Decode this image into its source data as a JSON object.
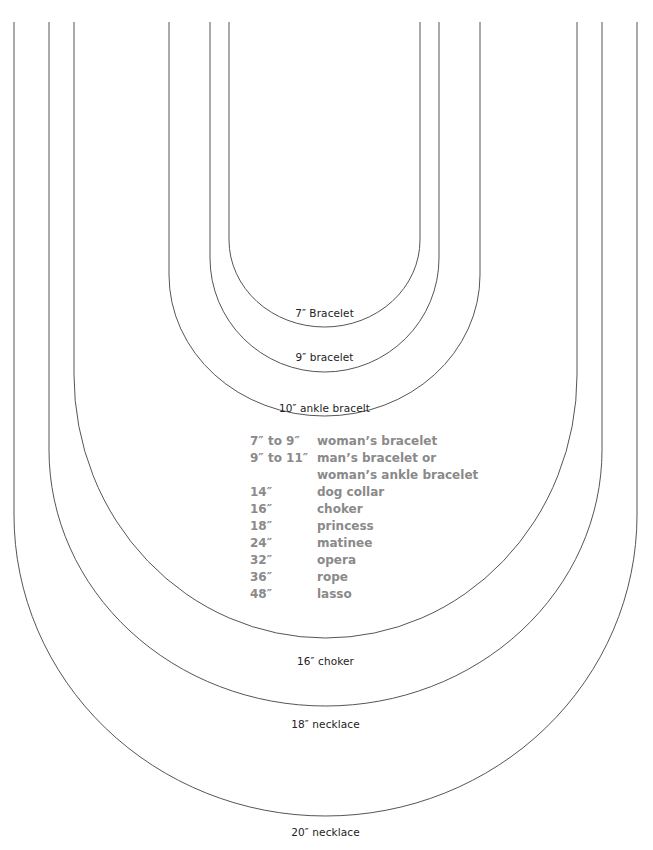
{
  "diagram": {
    "line_color": "#555555",
    "curves": [
      {
        "id": "7-bracelet",
        "label": "7″ Bracelet",
        "left_x": 229,
        "right_x": 420,
        "top_y": 22,
        "straight_to_y": 240,
        "bottom_y": 327,
        "label_y": 307
      },
      {
        "id": "9-bracelet",
        "label": "9″ bracelet",
        "left_x": 210,
        "right_x": 439,
        "top_y": 22,
        "straight_to_y": 258,
        "bottom_y": 372,
        "label_y": 351
      },
      {
        "id": "10-ankle-bracelet",
        "label": "10″ ankle bracelt",
        "left_x": 169,
        "right_x": 480,
        "top_y": 22,
        "straight_to_y": 275,
        "bottom_y": 416,
        "label_y": 402
      },
      {
        "id": "16-choker",
        "label": "16″ choker",
        "left_x": 74,
        "right_x": 577,
        "top_y": 22,
        "straight_to_y": 375,
        "bottom_y": 638,
        "label_y": 655
      },
      {
        "id": "18-necklace",
        "label": "18″ necklace",
        "left_x": 49,
        "right_x": 602,
        "top_y": 22,
        "straight_to_y": 450,
        "bottom_y": 706,
        "label_y": 718
      },
      {
        "id": "20-necklace",
        "label": "20″ necklace",
        "left_x": 14,
        "right_x": 637,
        "top_y": 22,
        "straight_to_y": 515,
        "bottom_y": 816,
        "label_y": 826
      }
    ]
  },
  "legend": {
    "color": "#8a8a8a",
    "rows": [
      {
        "length": "7″ to 9″",
        "description": "woman’s bracelet"
      },
      {
        "length": "9″ to 11″",
        "description": "man’s bracelet or"
      },
      {
        "length": "",
        "description": "woman’s ankle bracelet"
      },
      {
        "length": "14″",
        "description": "dog collar"
      },
      {
        "length": "16″",
        "description": "choker"
      },
      {
        "length": "18″",
        "description": "princess"
      },
      {
        "length": "24″",
        "description": "matinee"
      },
      {
        "length": "32″",
        "description": "opera"
      },
      {
        "length": "36″",
        "description": "rope"
      },
      {
        "length": "48″",
        "description": "lasso"
      }
    ]
  }
}
